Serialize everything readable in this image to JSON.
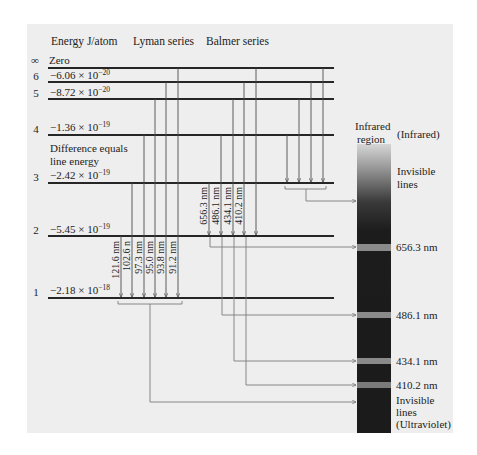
{
  "headers": {
    "energy": "Energy J/atom",
    "lyman": "Lyman series",
    "balmer": "Balmer series"
  },
  "levels": [
    {
      "n": "∞",
      "energy": "Zero",
      "exponent": ""
    },
    {
      "n": "6",
      "energy": "−6.06 × 10",
      "exponent": "−20"
    },
    {
      "n": "5",
      "energy": "−8.72 × 10",
      "exponent": "−20"
    },
    {
      "n": "4",
      "energy": "−1.36 × 10",
      "exponent": "−19"
    },
    {
      "n": "3",
      "energy": "−2.42 × 10",
      "exponent": "−19"
    },
    {
      "n": "2",
      "energy": "−5.45 × 10",
      "exponent": "−19"
    },
    {
      "n": "1",
      "energy": "−2.18 × 10",
      "exponent": "−18"
    }
  ],
  "note": {
    "line1": "Difference equals",
    "line2": "line energy"
  },
  "lyman_lines": [
    "121.6 nm",
    "102.6 n",
    "97.3 nm",
    "95.0 nm",
    "93.8 nm",
    "91.2 nm"
  ],
  "balmer_lines": [
    "656.3 nm",
    "486.1 nm",
    "434.1 nm",
    "410.2 nm"
  ],
  "spectrum": {
    "top_label_1": "Infrared",
    "top_label_2": "region",
    "infrared_label": "(Infrared)",
    "invisible_ir_1": "Invisible",
    "invisible_ir_2": "lines",
    "bands": [
      "656.3 nm",
      "486.1 nm",
      "434.1 nm",
      "410.2 nm"
    ],
    "uv_1": "Invisible",
    "uv_2": "lines",
    "uv_3": "(Ultraviolet)"
  },
  "colors": {
    "panel": "#eeeeee",
    "level_line": "#262626",
    "transition_line": "#4a4a4a",
    "spectrum_dark": "#1b1b1b",
    "spectrum_band": "#8a8a8a"
  }
}
